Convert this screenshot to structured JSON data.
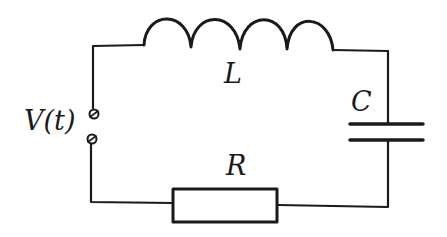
{
  "diagram": {
    "components": [
      {
        "id": "source",
        "type": "voltage-source-terminals",
        "label": "V(t)"
      },
      {
        "id": "inductor",
        "type": "inductor",
        "label": "L",
        "turns": 4
      },
      {
        "id": "capacitor",
        "type": "capacitor",
        "label": "C"
      },
      {
        "id": "resistor",
        "type": "resistor",
        "label": "R"
      }
    ],
    "labels": {
      "source": "V(t)",
      "inductor": "L",
      "capacitor": "C",
      "resistor": "R"
    },
    "colors": {
      "wire": "#1a1a1a",
      "background": "#ffffff"
    }
  }
}
